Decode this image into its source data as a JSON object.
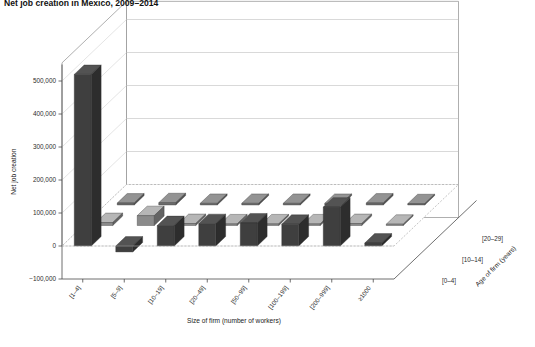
{
  "title": "Net job creation in Mexico, 2009–2014",
  "caption": "",
  "chart_data": {
    "type": "bar",
    "subtype": "3d-grouped-bar",
    "title": "Net job creation in Mexico, 2009–2014",
    "xlabel": "Size of firm (number of workers)",
    "ylabel": "Net job creation",
    "zlabel": "Age of firm (years)",
    "categories": [
      "[1–4]",
      "[5–9]",
      "[10–19]",
      "[20–49]",
      "[50–99]",
      "[100–199]",
      "[200–999]",
      "≥1000"
    ],
    "depth_categories": [
      "[0–4]",
      "[10–14]",
      "[20–29]"
    ],
    "ylim": [
      -100000,
      550000
    ],
    "yticks": [
      -100000,
      0,
      100000,
      200000,
      300000,
      400000,
      500000
    ],
    "ytick_labels": [
      "−100,000",
      "0",
      "100,000",
      "200,000",
      "300,000",
      "400,000",
      "500,000"
    ],
    "grid": true,
    "legend": "none",
    "series": [
      {
        "name": "[0–4]",
        "color": "#3f3f3f",
        "values": [
          520000,
          -18000,
          62000,
          68000,
          70000,
          66000,
          118000,
          9000
        ]
      },
      {
        "name": "[10–14]",
        "color": "#8a8a8a",
        "values": [
          9000,
          30000,
          6000,
          5000,
          5000,
          5000,
          6000,
          4000
        ]
      },
      {
        "name": "[20–29]",
        "color": "#6f6f6f",
        "values": [
          6000,
          7000,
          5000,
          5000,
          5000,
          5000,
          6000,
          4000
        ]
      }
    ]
  },
  "colors": {
    "front_row": "#3f3f3f",
    "mid_row": "#8a8a8a",
    "back_row": "#6f6f6f",
    "wall": "#8d8d8d",
    "grid": "#b9b9b9"
  }
}
